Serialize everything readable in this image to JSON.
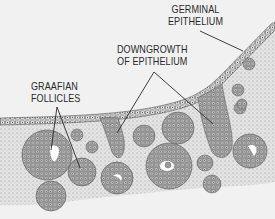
{
  "diagram": {
    "labels": [
      {
        "id": "germinal",
        "lines": [
          "GERMINAL",
          "EPITHELIUM"
        ]
      },
      {
        "id": "downgrowth",
        "lines": [
          "DOWNGROWTH",
          "OF EPITHELIUM"
        ]
      },
      {
        "id": "graafian",
        "lines": [
          "GRAAFIAN",
          "FOLLICLES"
        ]
      }
    ],
    "colors": {
      "background": "#f1f1f1",
      "ink": "#2a2a2a",
      "stroma": "#c9c9c9",
      "follicle": "#8a8a8a",
      "antrum": "#ffffff"
    }
  }
}
